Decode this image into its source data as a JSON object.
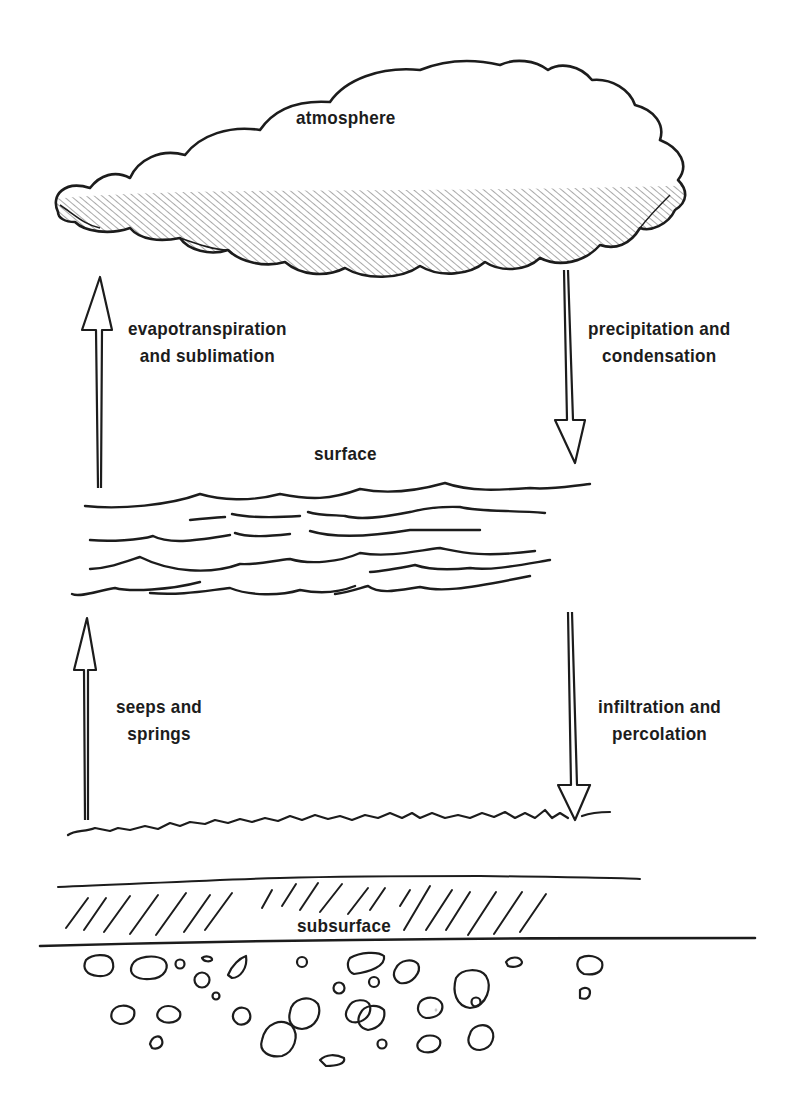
{
  "diagram": {
    "title": "",
    "ink_color": "#1c1c1c",
    "background": "#ffffff",
    "layers": {
      "atmosphere": {
        "label": "atmosphere"
      },
      "surface": {
        "label": "surface"
      },
      "subsurface": {
        "label": "subsurface"
      }
    },
    "flows": {
      "evapotranspiration": {
        "line1": "evapotranspiration",
        "line2": "and sublimation",
        "direction": "up",
        "from": "surface",
        "to": "atmosphere"
      },
      "precipitation": {
        "line1": "precipitation and",
        "line2": "condensation",
        "direction": "down",
        "from": "atmosphere",
        "to": "surface"
      },
      "seeps": {
        "line1": "seeps and",
        "line2": "springs",
        "direction": "up",
        "from": "subsurface",
        "to": "surface"
      },
      "infiltration": {
        "line1": "infiltration and",
        "line2": "percolation",
        "direction": "down",
        "from": "surface",
        "to": "subsurface"
      }
    }
  }
}
